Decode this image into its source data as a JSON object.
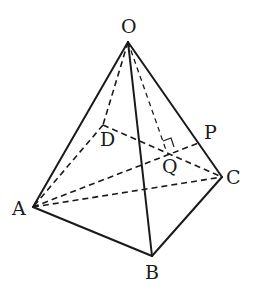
{
  "diagram": {
    "type": "pyramid",
    "points": {
      "O": {
        "label": "O",
        "x": 128,
        "y": 42
      },
      "A": {
        "label": "A",
        "x": 33,
        "y": 207
      },
      "B": {
        "label": "B",
        "x": 152,
        "y": 256
      },
      "C": {
        "label": "C",
        "x": 222,
        "y": 177
      },
      "D": {
        "label": "D",
        "x": 103,
        "y": 125
      },
      "P": {
        "label": "P",
        "x": 201,
        "y": 142
      },
      "Q": {
        "label": "Q",
        "x": 170,
        "y": 153
      }
    },
    "solid_edges": [
      "OA",
      "OB",
      "OC",
      "AB",
      "BC"
    ],
    "dashed_edges": [
      "OD",
      "DA",
      "DC",
      "AC",
      "AP",
      "OQ"
    ],
    "right_angle_at": "Q",
    "stroke_color": "#1a1a1a",
    "background": "#ffffff"
  }
}
